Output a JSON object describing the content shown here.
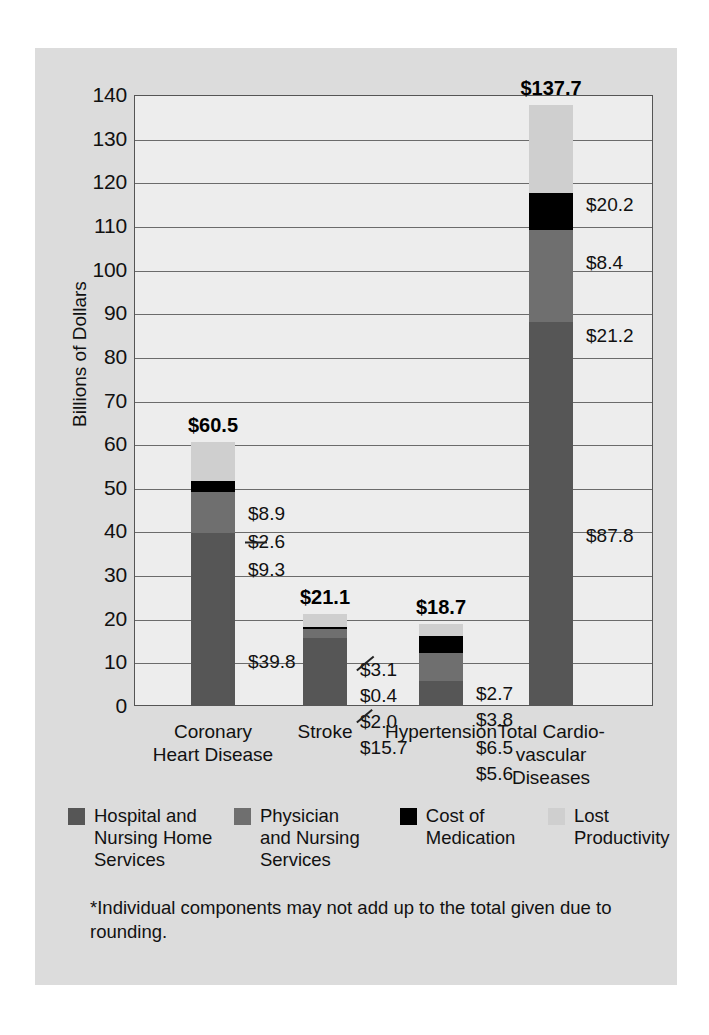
{
  "chart_data": {
    "type": "bar",
    "title": "",
    "subtitle": "",
    "xlabel": "",
    "ylabel": "Billions of Dollars",
    "ylim": [
      0,
      140
    ],
    "ytick_step": 10,
    "yticks": [
      "140",
      "130",
      "120",
      "110",
      "100",
      "90",
      "80",
      "70",
      "60",
      "50",
      "40",
      "30",
      "20",
      "10",
      "0"
    ],
    "grid": true,
    "stacked": true,
    "legend_position": "bottom",
    "categories": [
      "Coronary\nHeart Disease",
      "Stroke",
      "Hypertension",
      "Total Cardio-\nvascular\nDiseases"
    ],
    "series": [
      {
        "name": "Hospital and\nNursing Home\nServices",
        "color": "#565656",
        "values": [
          39.8,
          15.7,
          5.6,
          87.8
        ]
      },
      {
        "name": "Physician\nand Nursing\nServices",
        "color": "#6f6f6f",
        "values": [
          9.3,
          2.0,
          6.5,
          21.2
        ]
      },
      {
        "name": "Cost of\nMedication",
        "color": "#000000",
        "values": [
          2.6,
          0.4,
          3.8,
          8.4
        ]
      },
      {
        "name": "Lost\nProductivity",
        "color": "#cfcfcf",
        "values": [
          8.9,
          3.1,
          2.7,
          20.2
        ]
      }
    ],
    "totals": [
      60.5,
      21.1,
      18.7,
      137.7
    ],
    "total_labels": [
      "$60.5",
      "$21.1",
      "$18.7",
      "$137.7"
    ],
    "segment_labels": [
      [
        "$39.8",
        "$9.3",
        "$2.6",
        "$8.9"
      ],
      [
        "$15.7",
        "$2.0",
        "$0.4",
        "$3.1"
      ],
      [
        "$5.6",
        "$6.5",
        "$3.8",
        "$2.7"
      ],
      [
        "$87.8",
        "$21.2",
        "$8.4",
        "$20.2"
      ]
    ],
    "footnote": "*Individual components may not add up to the total given due to rounding."
  },
  "colors": {
    "card_background": "#dcdcdc",
    "plot_background": "#ededed",
    "frame": "#555555",
    "gridline": "#6b6b6b",
    "text": "#111111"
  }
}
